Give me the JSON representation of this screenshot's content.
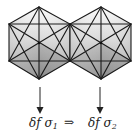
{
  "diagram": {
    "left_solid": {
      "name": "icosahedron-1",
      "label_prefix": "δf σ",
      "label_subscript": "1"
    },
    "right_solid": {
      "name": "icosahedron-2",
      "label_prefix": "δf σ",
      "label_subscript": "2"
    },
    "relation_symbol": "⇒",
    "colors": {
      "edge": "#1a1a1a",
      "shade_light": "#f4f4f4",
      "shade_dark": "#8a8a8a",
      "background": "#ffffff"
    }
  }
}
